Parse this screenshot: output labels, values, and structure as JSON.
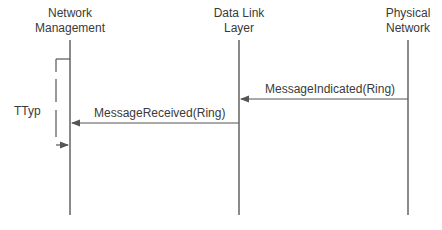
{
  "diagram": {
    "type": "sequence",
    "participants": [
      {
        "name": "Network Management",
        "lines": [
          "Network",
          "Management"
        ],
        "x": 70
      },
      {
        "name": "Data Link Layer",
        "lines": [
          "Data Link",
          "Layer"
        ],
        "x": 239
      },
      {
        "name": "Physical Network",
        "lines": [
          "Physical",
          "Network"
        ],
        "x": 408
      }
    ],
    "messages": [
      {
        "label": "MessageIndicated(Ring)",
        "from": "Physical Network",
        "to": "Data Link Layer"
      },
      {
        "label": "MessageReceived(Ring)",
        "from": "Data Link Layer",
        "to": "Network Management"
      }
    ],
    "timer": {
      "label": "TTyp"
    },
    "colors": {
      "line": "#8a8a8a",
      "arrow": "#555555",
      "text": "#3a3a3a"
    }
  }
}
